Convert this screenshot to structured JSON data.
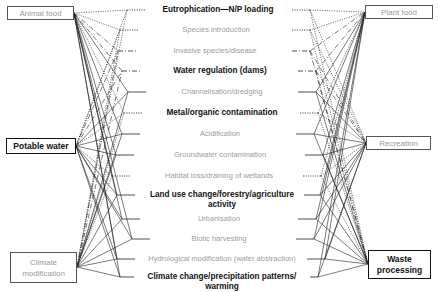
{
  "diagram": {
    "type": "network",
    "left_services": [
      {
        "id": "animal_food",
        "label": "Animal food",
        "style": "light"
      },
      {
        "id": "potable_water",
        "label": "Potable water",
        "style": "bold"
      },
      {
        "id": "climate_modification",
        "label": "Climate modification",
        "style": "light"
      }
    ],
    "right_services": [
      {
        "id": "plant_food",
        "label": "Plant food",
        "style": "light"
      },
      {
        "id": "recreation",
        "label": "Recreation",
        "style": "light"
      },
      {
        "id": "waste_processing",
        "label": "Waste processing",
        "style": "bold"
      }
    ],
    "pressures": [
      {
        "label": "Eutrophication—N/P loading",
        "style": "bold",
        "line": "dotted"
      },
      {
        "label": "Species introduction",
        "style": "light",
        "line": "dotted"
      },
      {
        "label": "Invasive species/disease",
        "style": "light",
        "line": "dashdot"
      },
      {
        "label": "Water regulation (dams)",
        "style": "bold",
        "line": "dashdot"
      },
      {
        "label": "Channelisation/dredging",
        "style": "light",
        "line": "solid"
      },
      {
        "label": "Metal/organic contamination",
        "style": "bold",
        "line": "dotted"
      },
      {
        "label": "Acidification",
        "style": "light",
        "line": "solid"
      },
      {
        "label": "Groundwater contamination",
        "style": "light",
        "line": "solid"
      },
      {
        "label": "Habitat loss/draining of wetlands",
        "style": "light",
        "line": "dotted"
      },
      {
        "label": "Land use change/forestry/agriculture activity",
        "style": "bold",
        "line": "solid"
      },
      {
        "label": "Urbanisation",
        "style": "light",
        "line": "solid"
      },
      {
        "label": "Biotic harvesting",
        "style": "light",
        "line": "solid"
      },
      {
        "label": "Hydrological modification (water abstraction)",
        "style": "light",
        "line": "solid"
      },
      {
        "label": "Climate change/precipitation patterns/ warming",
        "style": "bold",
        "line": "solid"
      }
    ]
  },
  "colors": {
    "bold_text": "#111111",
    "light_text": "#9a9a9a",
    "line": "#222222"
  }
}
